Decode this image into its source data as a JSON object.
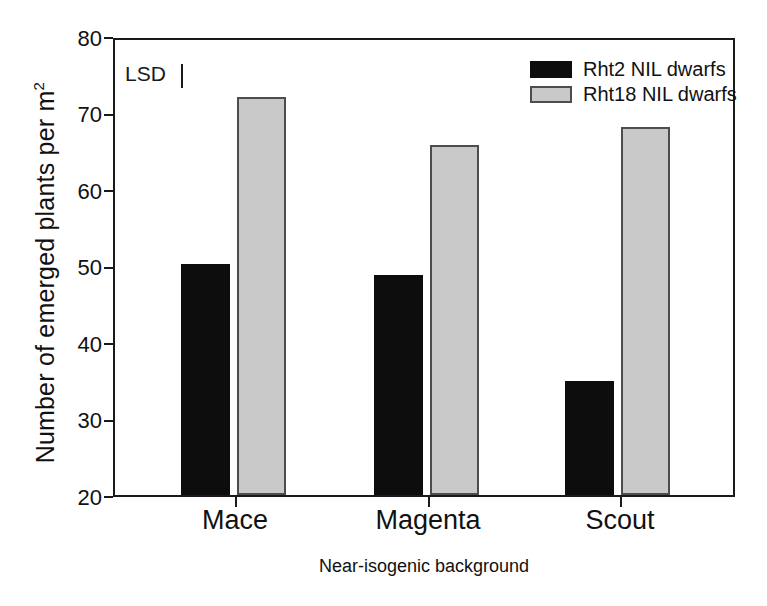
{
  "chart_data": {
    "type": "bar",
    "title": "",
    "xlabel": "Near-isogenic background",
    "ylabel": "Number of emerged plants per m",
    "ylabel_sup": "2",
    "categories": [
      "Mace",
      "Magenta",
      "Scout"
    ],
    "series": [
      {
        "name": "Rht2 NIL dwarfs",
        "color": "#0d0d0d",
        "values": [
          50.5,
          49.0,
          35.1
        ]
      },
      {
        "name": "Rht18 NIL dwarfs",
        "color": "#c9c9c9",
        "values": [
          72.5,
          66.2,
          68.5
        ]
      }
    ],
    "ylim": [
      20,
      80
    ],
    "yticks": [
      "80",
      "70",
      "60",
      "50",
      "40",
      "30",
      "20"
    ],
    "ytick_values": [
      80,
      70,
      60,
      50,
      40,
      30,
      20
    ],
    "grid": false,
    "legend_position": "top-right",
    "annotations": [
      {
        "name": "lsd",
        "label": "LSD",
        "marker": "vertical-bar"
      }
    ]
  },
  "colors": {
    "dark_series": "#0d0d0d",
    "light_series": "#c9c9c9",
    "axis": "#1a1a1a",
    "background": "#ffffff"
  }
}
